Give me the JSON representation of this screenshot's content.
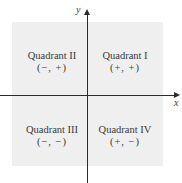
{
  "diagram": {
    "type": "cartesian-quadrants",
    "axes": {
      "x_label": "x",
      "y_label": "y"
    },
    "quadrants": [
      {
        "name": "Quadrant I",
        "signs": "(+, +)",
        "position": "top-right"
      },
      {
        "name": "Quadrant II",
        "signs": "(−, +)",
        "position": "top-left"
      },
      {
        "name": "Quadrant III",
        "signs": "(−, −)",
        "position": "bottom-left"
      },
      {
        "name": "Quadrant IV",
        "signs": "(+, −)",
        "position": "bottom-right"
      }
    ],
    "colors": {
      "plane": "#efefef",
      "axis": "#2b2b2b",
      "text": "#3a3a3a"
    }
  }
}
